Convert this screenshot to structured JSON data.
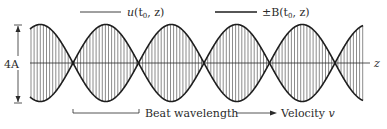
{
  "figure": {
    "type": "beat-wave-diagram",
    "legend": [
      {
        "label_main": "u",
        "label_args": "(t",
        "label_sub": "0",
        "label_tail": ", z)",
        "full": "u(t0, z)",
        "line_style": "thin"
      },
      {
        "label_main": "±B",
        "label_args": "(t",
        "label_sub": "0",
        "label_tail": ", z)",
        "full": "±B(t0, z)",
        "line_style": "thick"
      }
    ],
    "amplitude_label": "4A",
    "axis_label": "z",
    "beat_wavelength_label": "Beat wavelength",
    "velocity_label": "Velocity",
    "velocity_symbol": "v",
    "colors": {
      "ink": "#1e1e1e",
      "carrier": "#5a5a5a",
      "background": "#ffffff"
    }
  }
}
